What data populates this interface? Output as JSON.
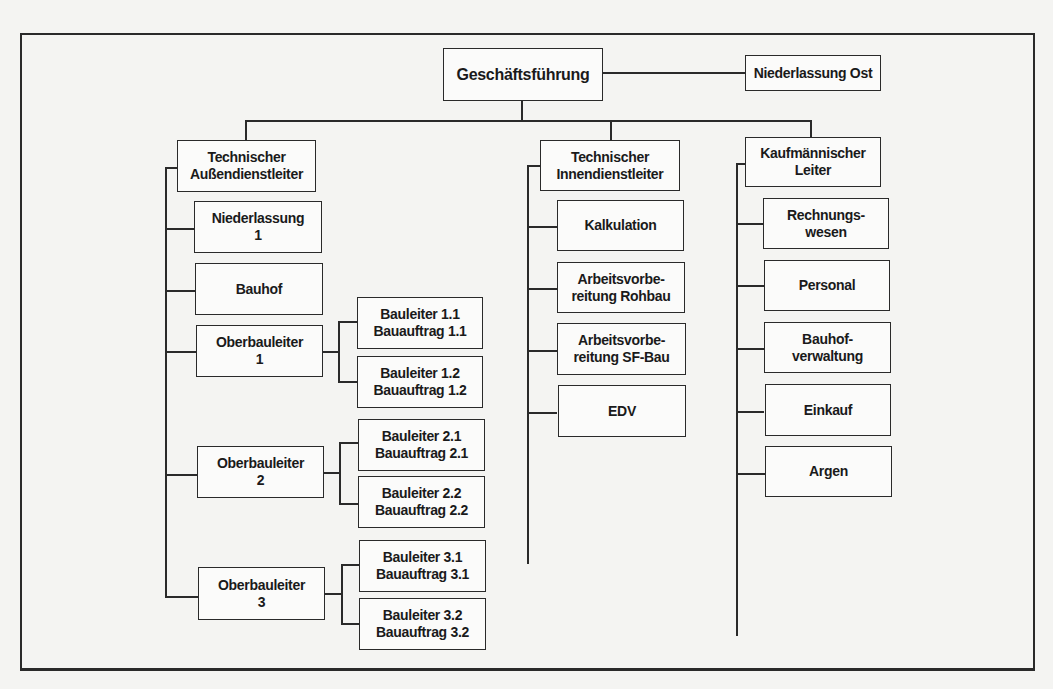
{
  "diagram": {
    "type": "org-chart",
    "root": {
      "label": "Geschäftsführung"
    },
    "side_unit": {
      "label": "Niederlassung Ost"
    },
    "departments": [
      {
        "label": "Technischer\nAußendienstleiter",
        "children": [
          {
            "label": "Niederlassung\n1"
          },
          {
            "label": "Bauhof"
          },
          {
            "label": "Oberbauleiter\n1",
            "children": [
              {
                "label": "Bauleiter 1.1\nBauauftrag 1.1"
              },
              {
                "label": "Bauleiter 1.2\nBauauftrag 1.2"
              }
            ]
          },
          {
            "label": "Oberbauleiter\n2",
            "children": [
              {
                "label": "Bauleiter 2.1\nBauauftrag 2.1"
              },
              {
                "label": "Bauleiter 2.2\nBauauftrag 2.2"
              }
            ]
          },
          {
            "label": "Oberbauleiter\n3",
            "children": [
              {
                "label": "Bauleiter 3.1\nBauauftrag 3.1"
              },
              {
                "label": "Bauleiter 3.2\nBauauftrag 3.2"
              }
            ]
          }
        ]
      },
      {
        "label": "Technischer\nInnendienstleiter",
        "children": [
          {
            "label": "Kalkulation"
          },
          {
            "label": "Arbeitsvorbe-\nreitung Rohbau"
          },
          {
            "label": "Arbeitsvorbe-\nreitung SF-Bau"
          },
          {
            "label": "EDV"
          }
        ]
      },
      {
        "label": "Kaufmännischer\nLeiter",
        "children": [
          {
            "label": "Rechnungs-\nwesen"
          },
          {
            "label": "Personal"
          },
          {
            "label": "Bauhof-\nverwaltung"
          },
          {
            "label": "Einkauf"
          },
          {
            "label": "Argen"
          }
        ]
      }
    ]
  },
  "colors": {
    "line": "#2a2a2a",
    "page": "#f4f4f2",
    "box": "#fbfbfa"
  }
}
